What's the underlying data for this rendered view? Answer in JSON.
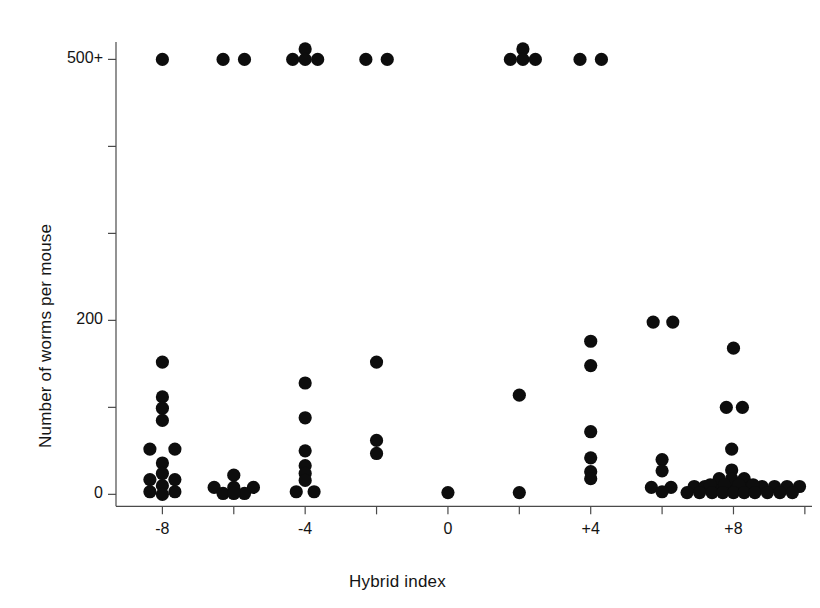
{
  "figure": {
    "background_color": "#ffffff",
    "axis_color": "#4a4a4a",
    "point_color": "#0d0d0d"
  },
  "axes": {
    "x": {
      "label": "Hybrid index",
      "min": -9.3,
      "max": 10.2,
      "ticks": [
        -8,
        -6,
        -4,
        -2,
        0,
        2,
        4,
        6,
        8,
        10
      ],
      "tick_labels": [
        "-8",
        "",
        "-4",
        "",
        "0",
        "",
        "+4",
        "",
        "+8",
        ""
      ]
    },
    "y": {
      "label": "Number of worms per mouse",
      "min": -18,
      "max": 520,
      "ticks": [
        0,
        100,
        200,
        300,
        400,
        500
      ],
      "tick_labels": [
        "0",
        "",
        "200",
        "",
        "",
        "500+"
      ]
    }
  },
  "chart_data": {
    "type": "scatter",
    "title": "",
    "xlabel": "Hybrid index",
    "ylabel": "Number of worms per mouse",
    "xlim": [
      -9.3,
      10.2
    ],
    "ylim": [
      -18,
      520
    ],
    "grid": false,
    "legend": null,
    "marker": "filled-circle",
    "marker_size_px": 13,
    "note": "Values of 500 represent the censored '500+' category plotted on the top axis line.",
    "points": [
      {
        "x": -8.0,
        "y": 500
      },
      {
        "x": -8.0,
        "y": 152
      },
      {
        "x": -8.0,
        "y": 112
      },
      {
        "x": -8.0,
        "y": 99
      },
      {
        "x": -8.0,
        "y": 85
      },
      {
        "x": -8.35,
        "y": 52
      },
      {
        "x": -7.65,
        "y": 52
      },
      {
        "x": -8.0,
        "y": 36
      },
      {
        "x": -8.0,
        "y": 24
      },
      {
        "x": -8.35,
        "y": 17
      },
      {
        "x": -7.65,
        "y": 17
      },
      {
        "x": -8.0,
        "y": 10
      },
      {
        "x": -8.35,
        "y": 3
      },
      {
        "x": -7.65,
        "y": 3
      },
      {
        "x": -8.0,
        "y": 0
      },
      {
        "x": -6.3,
        "y": 500
      },
      {
        "x": -5.7,
        "y": 500
      },
      {
        "x": -6.0,
        "y": 22
      },
      {
        "x": -6.55,
        "y": 8
      },
      {
        "x": -6.0,
        "y": 8
      },
      {
        "x": -5.45,
        "y": 8
      },
      {
        "x": -6.3,
        "y": 1
      },
      {
        "x": -5.7,
        "y": 1
      },
      {
        "x": -6.0,
        "y": 1
      },
      {
        "x": -4.35,
        "y": 500
      },
      {
        "x": -4.0,
        "y": 512
      },
      {
        "x": -4.0,
        "y": 500
      },
      {
        "x": -3.65,
        "y": 500
      },
      {
        "x": -4.0,
        "y": 128
      },
      {
        "x": -4.0,
        "y": 88
      },
      {
        "x": -4.0,
        "y": 50
      },
      {
        "x": -4.0,
        "y": 33
      },
      {
        "x": -4.0,
        "y": 24
      },
      {
        "x": -4.0,
        "y": 16
      },
      {
        "x": -4.25,
        "y": 3
      },
      {
        "x": -3.75,
        "y": 3
      },
      {
        "x": -2.3,
        "y": 500
      },
      {
        "x": -1.7,
        "y": 500
      },
      {
        "x": -2.0,
        "y": 152
      },
      {
        "x": -2.0,
        "y": 62
      },
      {
        "x": -2.0,
        "y": 47
      },
      {
        "x": 0.0,
        "y": 2
      },
      {
        "x": 1.75,
        "y": 500
      },
      {
        "x": 2.1,
        "y": 512
      },
      {
        "x": 2.1,
        "y": 500
      },
      {
        "x": 2.45,
        "y": 500
      },
      {
        "x": 2.0,
        "y": 114
      },
      {
        "x": 2.0,
        "y": 2
      },
      {
        "x": 3.7,
        "y": 500
      },
      {
        "x": 4.3,
        "y": 500
      },
      {
        "x": 4.0,
        "y": 176
      },
      {
        "x": 4.0,
        "y": 148
      },
      {
        "x": 4.0,
        "y": 72
      },
      {
        "x": 4.0,
        "y": 42
      },
      {
        "x": 4.0,
        "y": 26
      },
      {
        "x": 4.0,
        "y": 18
      },
      {
        "x": 5.75,
        "y": 198
      },
      {
        "x": 6.3,
        "y": 198
      },
      {
        "x": 6.0,
        "y": 40
      },
      {
        "x": 6.0,
        "y": 27
      },
      {
        "x": 5.7,
        "y": 8
      },
      {
        "x": 6.25,
        "y": 8
      },
      {
        "x": 6.0,
        "y": 3
      },
      {
        "x": 7.6,
        "y": 9
      },
      {
        "x": 8.05,
        "y": 9
      },
      {
        "x": 8.0,
        "y": 168
      },
      {
        "x": 7.8,
        "y": 100
      },
      {
        "x": 8.25,
        "y": 100
      },
      {
        "x": 7.95,
        "y": 52
      },
      {
        "x": 7.95,
        "y": 28
      },
      {
        "x": 7.6,
        "y": 18
      },
      {
        "x": 7.95,
        "y": 18
      },
      {
        "x": 8.3,
        "y": 18
      },
      {
        "x": 6.9,
        "y": 9
      },
      {
        "x": 7.2,
        "y": 9
      },
      {
        "x": 8.5,
        "y": 9
      },
      {
        "x": 8.8,
        "y": 9
      },
      {
        "x": 9.15,
        "y": 9
      },
      {
        "x": 9.5,
        "y": 9
      },
      {
        "x": 9.85,
        "y": 9
      },
      {
        "x": 7.35,
        "y": 11
      },
      {
        "x": 7.75,
        "y": 11
      },
      {
        "x": 8.15,
        "y": 11
      },
      {
        "x": 8.55,
        "y": 11
      },
      {
        "x": 6.7,
        "y": 2
      },
      {
        "x": 7.05,
        "y": 2
      },
      {
        "x": 7.4,
        "y": 2
      },
      {
        "x": 7.7,
        "y": 2
      },
      {
        "x": 8.0,
        "y": 2
      },
      {
        "x": 8.3,
        "y": 2
      },
      {
        "x": 8.6,
        "y": 2
      },
      {
        "x": 8.95,
        "y": 2
      },
      {
        "x": 9.3,
        "y": 2
      },
      {
        "x": 9.65,
        "y": 2
      }
    ]
  }
}
